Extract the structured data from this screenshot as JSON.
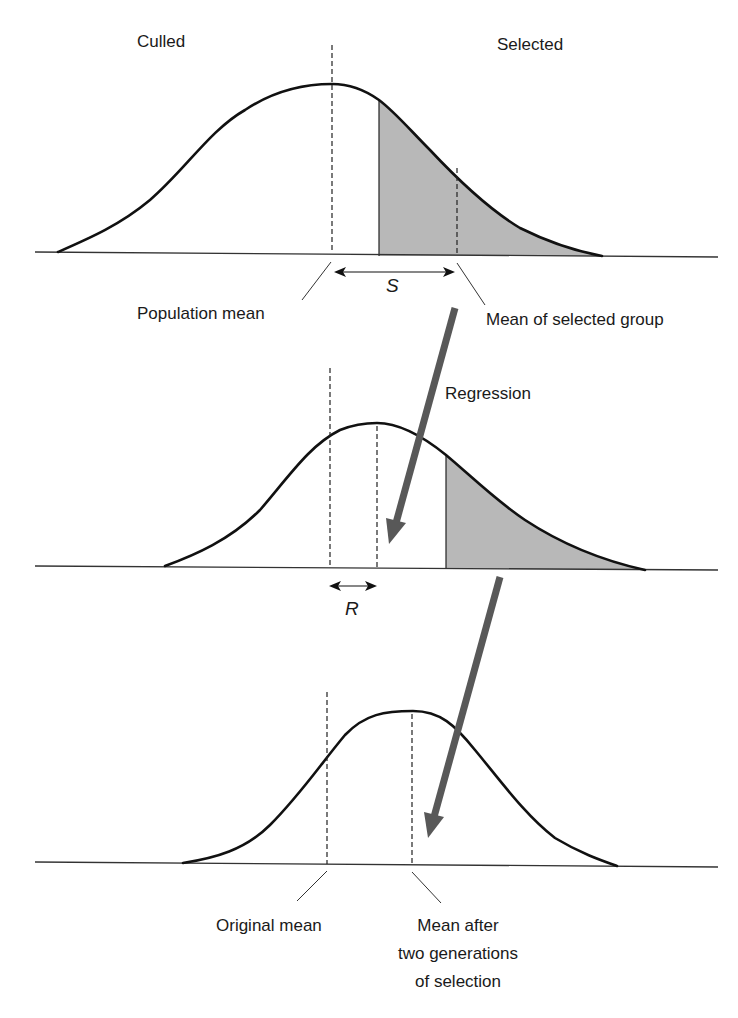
{
  "figure": {
    "colors": {
      "curve": "#111111",
      "shading": "#b8b8b8",
      "arrow": "#585858",
      "background": "#ffffff"
    }
  },
  "panels": [
    {
      "id": "generation-1",
      "labels": {
        "left_region": "Culled",
        "right_region": "Selected",
        "population_mean": "Population mean",
        "selected_mean": "Mean of selected group",
        "differential_symbol": "S"
      }
    },
    {
      "id": "generation-2",
      "labels": {
        "arrow_label": "Regression",
        "response_symbol": "R"
      }
    },
    {
      "id": "generation-3",
      "labels": {
        "original_mean": "Original mean",
        "final_mean_line1": "Mean after",
        "final_mean_line2": "two generations",
        "final_mean_line3": "of selection"
      }
    }
  ]
}
